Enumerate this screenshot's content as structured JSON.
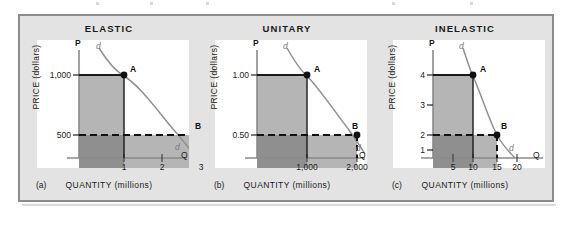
{
  "figure": {
    "caption_axis": "QUANTITY  (millions)",
    "caption_yaxis": "PRICE  (dollars)",
    "curve_label": "d",
    "point_a": "A",
    "point_b": "B",
    "axis_p": "P",
    "axis_q": "Q",
    "colors": {
      "frame_border": "#8c8c8c",
      "frame_bg": "#e3e3e3",
      "plot_bg": "#ffffff",
      "rect_upper": "#b5b5b5",
      "rect_lower_left": "#8f8f8f",
      "rect_lower_right": "#b5b5b5",
      "axis": "#8a8a8a",
      "curve": "#909090",
      "marker": "#111111",
      "text": "#1a1a1a"
    }
  },
  "panels": [
    {
      "key": "elastic",
      "letter": "(a)",
      "title": "ELASTIC",
      "y_ticks": [
        "1,000",
        "500"
      ],
      "x_ticks": [
        "1",
        "2",
        "3"
      ],
      "point_a": "A",
      "point_b": "B",
      "curve_label_top": "d",
      "curve_label_end": "d",
      "axis_p": "P",
      "axis_q": "Q",
      "xlabel": "QUANTITY  (millions)",
      "ylabel": "PRICE  (dollars)"
    },
    {
      "key": "unitary",
      "letter": "(b)",
      "title": "UNITARY",
      "y_ticks": [
        "1.00",
        "0.50"
      ],
      "x_ticks": [
        "1,000",
        "2,000"
      ],
      "point_a": "A",
      "point_b": "B",
      "curve_label_top": "d",
      "curve_label_end": "d",
      "axis_p": "P",
      "axis_q": "Q",
      "xlabel": "QUANTITY  (millions)",
      "ylabel": "PRICE  (dollars)"
    },
    {
      "key": "inelastic",
      "letter": "(c)",
      "title": "INELASTIC",
      "y_ticks": [
        "4",
        "3",
        "2",
        "1"
      ],
      "x_ticks": [
        "5",
        "10",
        "15",
        "20"
      ],
      "point_a": "A",
      "point_b": "B",
      "curve_label_top": "d",
      "curve_label_end": "d",
      "axis_p": "P",
      "axis_q": "Q",
      "xlabel": "QUANTITY  (millions)",
      "ylabel": "PRICE  (dollars)"
    }
  ],
  "chart_data": [
    {
      "type": "line",
      "title": "ELASTIC",
      "panel": "(a)",
      "xlabel": "QUANTITY  (millions)",
      "ylabel": "PRICE  (dollars)",
      "xlim": [
        0,
        3.6
      ],
      "ylim": [
        0,
        1300
      ],
      "xticks": [
        1,
        2,
        3
      ],
      "xticklabels": [
        "1",
        "2",
        "3"
      ],
      "yticks": [
        500,
        1000
      ],
      "yticklabels": [
        "500",
        "1,000"
      ],
      "series": [
        {
          "name": "d",
          "x": [
            0.55,
            0.8,
            1.0,
            1.4,
            2.0,
            2.5,
            3.0,
            3.45
          ],
          "y": [
            1300,
            1130,
            1000,
            820,
            650,
            560,
            500,
            430
          ]
        }
      ],
      "points": [
        {
          "label": "A",
          "x": 1,
          "y": 1000
        },
        {
          "label": "B",
          "x": 3,
          "y": 500
        }
      ],
      "revenue_rectangles": [
        {
          "name": "upper",
          "x0": 0,
          "x1": 1,
          "y0": 500,
          "y1": 1000
        },
        {
          "name": "lower-left",
          "x0": 0,
          "x1": 1,
          "y0": 0,
          "y1": 500
        },
        {
          "name": "lower-right",
          "x0": 1,
          "x1": 3,
          "y0": 0,
          "y1": 500
        }
      ],
      "grid": false,
      "legend": "none"
    },
    {
      "type": "line",
      "title": "UNITARY",
      "panel": "(b)",
      "xlabel": "QUANTITY  (millions)",
      "ylabel": "PRICE  (dollars)",
      "xlim": [
        0,
        2400
      ],
      "ylim": [
        0,
        1.35
      ],
      "xticks": [
        1000,
        2000
      ],
      "xticklabels": [
        "1,000",
        "2,000"
      ],
      "yticks": [
        0.5,
        1.0
      ],
      "yticklabels": [
        "0.50",
        "1.00"
      ],
      "series": [
        {
          "name": "d",
          "x": [
            620,
            760,
            1000,
            1300,
            1600,
            2000,
            2300
          ],
          "y": [
            1.35,
            1.22,
            1.0,
            0.78,
            0.64,
            0.5,
            0.42
          ]
        }
      ],
      "points": [
        {
          "label": "A",
          "x": 1000,
          "y": 1.0
        },
        {
          "label": "B",
          "x": 2000,
          "y": 0.5
        }
      ],
      "revenue_rectangles": [
        {
          "name": "upper",
          "x0": 0,
          "x1": 1000,
          "y0": 0.5,
          "y1": 1.0
        },
        {
          "name": "lower-left",
          "x0": 0,
          "x1": 1000,
          "y0": 0,
          "y1": 0.5
        },
        {
          "name": "lower-right",
          "x0": 1000,
          "x1": 2000,
          "y0": 0,
          "y1": 0.5
        }
      ],
      "grid": false,
      "legend": "none"
    },
    {
      "type": "line",
      "title": "INELASTIC",
      "panel": "(c)",
      "xlabel": "QUANTITY  (millions)",
      "ylabel": "PRICE  (dollars)",
      "xlim": [
        0,
        23
      ],
      "ylim": [
        0,
        5.4
      ],
      "xticks": [
        5,
        10,
        15,
        20
      ],
      "xticklabels": [
        "5",
        "10",
        "15",
        "20"
      ],
      "yticks": [
        1,
        2,
        3,
        4
      ],
      "yticklabels": [
        "1",
        "2",
        "3",
        "4"
      ],
      "series": [
        {
          "name": "d",
          "x": [
            8.6,
            9.2,
            10,
            12,
            13.5,
            15,
            16.5,
            17.6
          ],
          "y": [
            5.4,
            4.8,
            4.0,
            2.9,
            2.4,
            2.0,
            1.5,
            1.05
          ]
        }
      ],
      "points": [
        {
          "label": "A",
          "x": 10,
          "y": 4
        },
        {
          "label": "B",
          "x": 15,
          "y": 2
        }
      ],
      "revenue_rectangles": [
        {
          "name": "upper",
          "x0": 0,
          "x1": 10,
          "y0": 2,
          "y1": 4
        },
        {
          "name": "lower-left",
          "x0": 0,
          "x1": 10,
          "y0": 0,
          "y1": 2
        },
        {
          "name": "lower-right",
          "x0": 10,
          "x1": 15,
          "y0": 0,
          "y1": 2
        }
      ],
      "grid": false,
      "legend": "none"
    }
  ]
}
